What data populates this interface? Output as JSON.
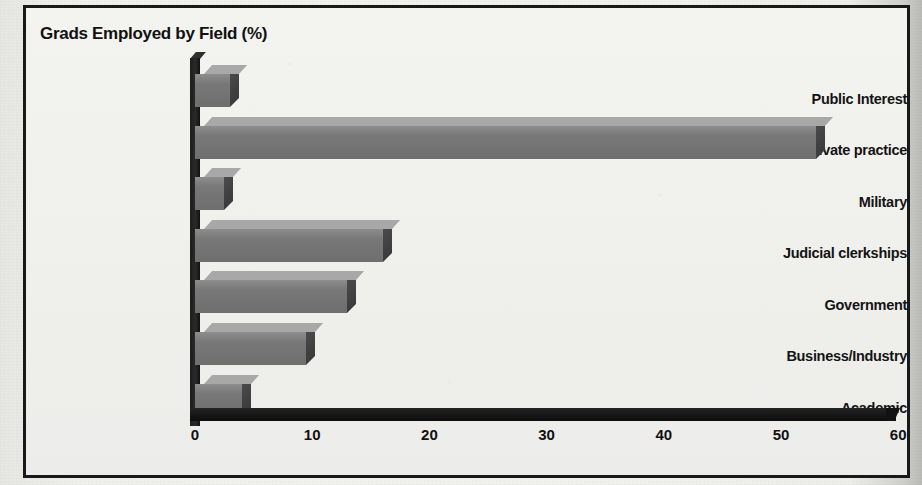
{
  "chart_data": {
    "type": "bar",
    "orientation": "horizontal",
    "title": "Grads Employed by Field (%)",
    "xlabel": "",
    "ylabel": "",
    "categories": [
      "Public Interest",
      "Private practice",
      "Military",
      "Judicial clerkships",
      "Government",
      "Business/Industry",
      "Academic"
    ],
    "values": [
      3,
      53,
      2.5,
      16,
      13,
      9.5,
      4
    ],
    "xlim": [
      0,
      60
    ],
    "xticks": [
      0,
      10,
      20,
      30,
      40,
      50,
      60
    ],
    "xtick_labels": [
      "0",
      "10",
      "20",
      "30",
      "40",
      "50",
      "60"
    ],
    "grid": false,
    "legend": null,
    "style": "3d-horizontal-bar",
    "colors": {
      "bar_front": "#787878",
      "bar_top": "#a8a8a8",
      "bar_side": "#3f3f3f",
      "axis": "#151515",
      "text": "#141414",
      "background": "#f0f0ed",
      "frame_border": "#191919"
    }
  },
  "figure": {
    "title": "Grads Employed by Field (%)",
    "frame_label": "chart-frame"
  }
}
